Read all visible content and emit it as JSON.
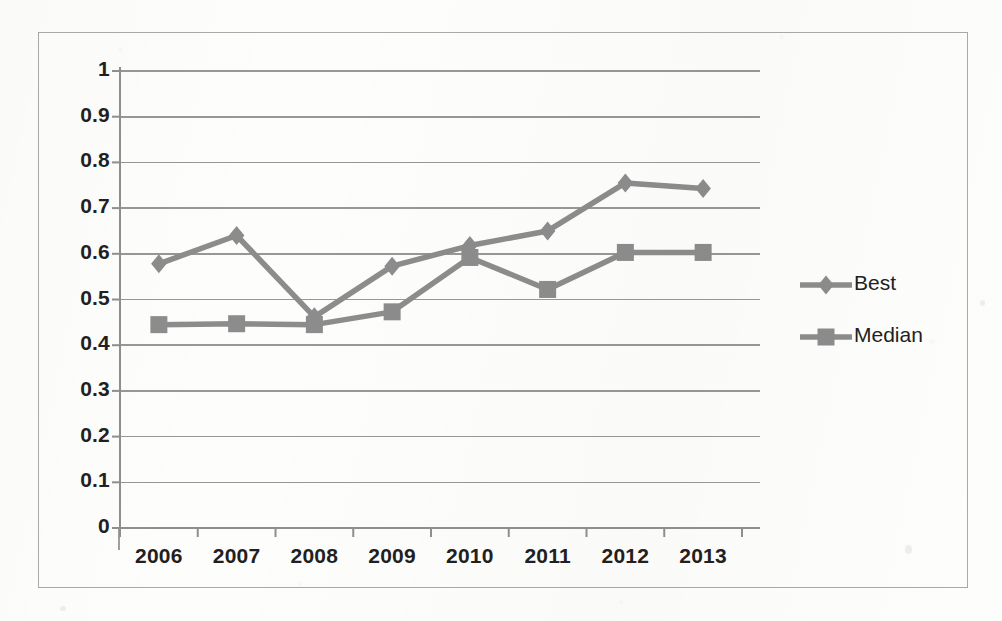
{
  "chart_data": {
    "type": "line",
    "title": "",
    "subtitle": "",
    "xlabel": "",
    "ylabel": "",
    "categories": [
      "2006",
      "2007",
      "2008",
      "2009",
      "2010",
      "2011",
      "2012",
      "2013"
    ],
    "series": [
      {
        "name": "Best",
        "marker": "diamond",
        "color": "#8c8c8c",
        "values": [
          0.578,
          0.64,
          0.462,
          0.573,
          0.618,
          0.65,
          0.755,
          0.743
        ]
      },
      {
        "name": "Median",
        "marker": "square",
        "color": "#8c8c8c",
        "values": [
          0.445,
          0.447,
          0.445,
          0.473,
          0.592,
          0.522,
          0.603,
          0.603
        ]
      }
    ],
    "ylim": [
      0,
      1
    ],
    "ytick_step": 0.1,
    "ytick_labels": [
      "1",
      "0.9",
      "0.8",
      "0.7",
      "0.6",
      "0.5",
      "0.4",
      "0.3",
      "0.2",
      "0.1",
      "0"
    ],
    "grid": {
      "horizontal": true,
      "vertical": false
    },
    "legend": {
      "position": "right",
      "entries": [
        {
          "label": "Best",
          "marker": "diamond"
        },
        {
          "label": "Median",
          "marker": "square"
        }
      ]
    }
  },
  "axes": {
    "y_labels": [
      "1",
      "0.9",
      "0.8",
      "0.7",
      "0.6",
      "0.5",
      "0.4",
      "0.3",
      "0.2",
      "0.1",
      "0"
    ],
    "x_labels": [
      "2006",
      "2007",
      "2008",
      "2009",
      "2010",
      "2011",
      "2012",
      "2013"
    ]
  },
  "legend": {
    "best_label": "Best",
    "median_label": "Median"
  },
  "colors": {
    "series": "#8c8c8c",
    "gridline": "#8f8f8f",
    "axis": "#8f8f8f",
    "border": "#a9a9a9",
    "text": "#231f20",
    "background": "#fdfdfc"
  }
}
